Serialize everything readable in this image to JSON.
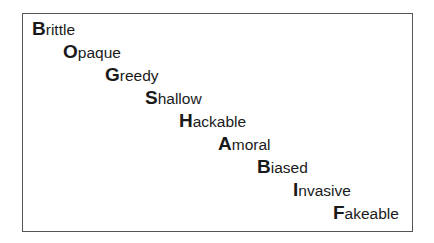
{
  "words": [
    {
      "initial": "B",
      "rest": "rittle",
      "x": 9,
      "y": 6
    },
    {
      "initial": "O",
      "rest": "paque",
      "x": 40,
      "y": 29
    },
    {
      "initial": "G",
      "rest": "reedy",
      "x": 82,
      "y": 52
    },
    {
      "initial": "S",
      "rest": "hallow",
      "x": 122,
      "y": 75
    },
    {
      "initial": "H",
      "rest": "ackable",
      "x": 156,
      "y": 98
    },
    {
      "initial": "A",
      "rest": "moral",
      "x": 195,
      "y": 121
    },
    {
      "initial": "B",
      "rest": "iased",
      "x": 234,
      "y": 144
    },
    {
      "initial": "I",
      "rest": "nvasive",
      "x": 270,
      "y": 167
    },
    {
      "initial": "F",
      "rest": "akeable",
      "x": 310,
      "y": 190
    }
  ],
  "acronym": "BOGSHABIF"
}
